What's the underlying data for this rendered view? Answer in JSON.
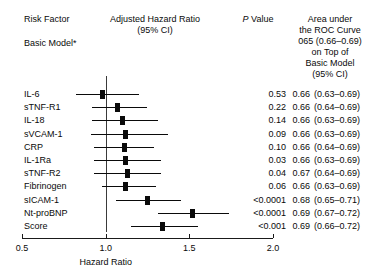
{
  "header": {
    "risk_factor": "Risk Factor",
    "basic_model": "Basic Model*",
    "ahr_line1": "Adjusted Hazard Ratio",
    "ahr_line2": "(95% CI)",
    "p_value_italic": "P",
    "p_value_rest": " Value",
    "auc_lines": [
      "Area under",
      "the ROC Curve",
      "065 (0.66–0.69)",
      "on Top of",
      "Basic Model",
      "(95% CI)"
    ]
  },
  "axis": {
    "title": "Hazard Ratio",
    "ticks": [
      "0.5",
      "1.0",
      "1.5",
      "2.0"
    ],
    "tick_values": [
      0.5,
      1.0,
      1.5,
      2.0
    ],
    "min": 0.5,
    "max": 2.0,
    "reference_value": 1.0
  },
  "columns": {
    "risk_factor": "Risk Factor",
    "hazard_ratio": "Adjusted Hazard Ratio (95% CI)",
    "p_value": "P Value",
    "auc": "Area under the ROC Curve on Top of Basic Model (95% CI)"
  },
  "chart_data": {
    "type": "forest",
    "title": "Adjusted Hazard Ratio (95% CI)",
    "xlabel": "Hazard Ratio",
    "ylabel": "",
    "xlim": [
      0.5,
      2.0
    ],
    "xticks": [
      0.5,
      1.0,
      1.5,
      2.0
    ],
    "grid": false,
    "reference_line": 1.0,
    "legend": "none",
    "categories": [
      "IL-6",
      "sTNF-R1",
      "IL-18",
      "sVCAM-1",
      "CRP",
      "IL-1Ra",
      "sTNF-R2",
      "Fibrinogen",
      "sICAM-1",
      "Nt-proBNP",
      "Score"
    ],
    "rows": [
      {
        "label": "IL-6",
        "hr": 0.98,
        "lcl": 0.82,
        "ucl": 1.2,
        "p": "0.53",
        "auc": "0.66",
        "auc_ci": "(0.63–0.69)"
      },
      {
        "label": "sTNF-R1",
        "hr": 1.07,
        "lcl": 0.92,
        "ucl": 1.25,
        "p": "0.22",
        "auc": "0.66",
        "auc_ci": "(0.64–0.69)"
      },
      {
        "label": "IL-18",
        "hr": 1.1,
        "lcl": 0.92,
        "ucl": 1.31,
        "p": "0.14",
        "auc": "0.66",
        "auc_ci": "(0.63–0.69)"
      },
      {
        "label": "sVCAM-1",
        "hr": 1.12,
        "lcl": 0.91,
        "ucl": 1.37,
        "p": "0.09",
        "auc": "0.66",
        "auc_ci": "(0.63–0.69)"
      },
      {
        "label": "CRP",
        "hr": 1.11,
        "lcl": 0.93,
        "ucl": 1.29,
        "p": "0.10",
        "auc": "0.66",
        "auc_ci": "(0.64–0.69)"
      },
      {
        "label": "IL-1Ra",
        "hr": 1.12,
        "lcl": 0.93,
        "ucl": 1.33,
        "p": "0.03",
        "auc": "0.66",
        "auc_ci": "(0.63–0.69)"
      },
      {
        "label": "sTNF-R2",
        "hr": 1.13,
        "lcl": 0.93,
        "ucl": 1.33,
        "p": "0.04",
        "auc": "0.67",
        "auc_ci": "(0.64–0.69)"
      },
      {
        "label": "Fibrinogen",
        "hr": 1.12,
        "lcl": 0.98,
        "ucl": 1.3,
        "p": "0.06",
        "auc": "0.66",
        "auc_ci": "(0.63–0.69)"
      },
      {
        "label": "sICAM-1",
        "hr": 1.25,
        "lcl": 1.06,
        "ucl": 1.45,
        "p": "<0.0001",
        "auc": "0.68",
        "auc_ci": "(0.65–0.71)"
      },
      {
        "label": "Nt-proBNP",
        "hr": 1.52,
        "lcl": 1.31,
        "ucl": 1.74,
        "p": "<0.0001",
        "auc": "0.69",
        "auc_ci": "(0.67–0.72)"
      },
      {
        "label": "Score",
        "hr": 1.34,
        "lcl": 1.15,
        "ucl": 1.55,
        "p": "<0.001",
        "auc": "0.69",
        "auc_ci": "(0.66–0.72)"
      }
    ]
  },
  "style": {
    "marker_color": "#0a0a0a",
    "line_color": "#0a0a0a",
    "axis_color": "#1a1a1a",
    "reference_color": "#3a3a3a",
    "background": "#ffffff"
  }
}
